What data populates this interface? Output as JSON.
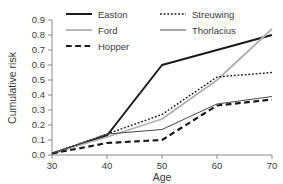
{
  "chart_data": {
    "type": "line",
    "title": "",
    "xlabel": "Age",
    "ylabel": "Cumulative risk",
    "x": [
      30,
      40,
      50,
      60,
      70
    ],
    "xlim": [
      30,
      70
    ],
    "ylim": [
      0.0,
      0.9
    ],
    "xticks": [
      "30",
      "40",
      "50",
      "60",
      "70"
    ],
    "yticks": [
      "0.0",
      "0.1",
      "0.2",
      "0.3",
      "0.4",
      "0.5",
      "0.6",
      "0.7",
      "0.8",
      "0.9"
    ],
    "grid": false,
    "legend_position": "top-center",
    "series": [
      {
        "name": "Easton",
        "values": [
          0.01,
          0.13,
          0.6,
          0.7,
          0.8
        ],
        "color": "#1a1a1a",
        "style": "solid",
        "width": 2.0
      },
      {
        "name": "Ford",
        "values": [
          0.01,
          0.12,
          0.24,
          0.5,
          0.84
        ],
        "color": "#b0b0b0",
        "style": "solid",
        "width": 1.8
      },
      {
        "name": "Hopper",
        "values": [
          0.01,
          0.08,
          0.1,
          0.33,
          0.37
        ],
        "color": "#1a1a1a",
        "style": "dashed",
        "width": 2.2
      },
      {
        "name": "Streuwing",
        "values": [
          0.01,
          0.14,
          0.27,
          0.52,
          0.55
        ],
        "color": "#1a1a1a",
        "style": "dotted",
        "width": 1.4
      },
      {
        "name": "Thorlacius",
        "values": [
          0.01,
          0.14,
          0.17,
          0.34,
          0.39
        ],
        "color": "#4a4a4a",
        "style": "solid",
        "width": 1.0
      }
    ]
  },
  "legend": {
    "entries": [
      {
        "label": "Easton",
        "column": 0,
        "row": 0
      },
      {
        "label": "Streuwing",
        "column": 1,
        "row": 0
      },
      {
        "label": "Ford",
        "column": 0,
        "row": 1
      },
      {
        "label": "Thorlacius",
        "column": 1,
        "row": 1
      },
      {
        "label": "Hopper",
        "column": 0,
        "row": 2
      }
    ]
  },
  "colors": {
    "axis": "#8a8a8a",
    "text": "#3a3a3a",
    "background": "#ffffff"
  }
}
